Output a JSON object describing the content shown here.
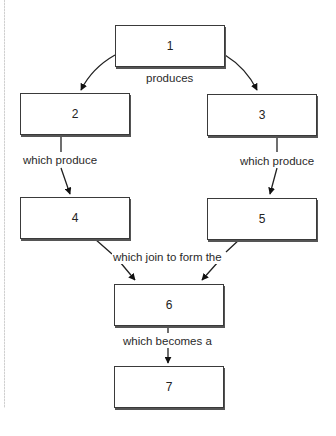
{
  "diagram": {
    "type": "flowchart",
    "nodes": [
      {
        "id": "1",
        "label": "1"
      },
      {
        "id": "2",
        "label": "2"
      },
      {
        "id": "3",
        "label": "3"
      },
      {
        "id": "4",
        "label": "4"
      },
      {
        "id": "5",
        "label": "5"
      },
      {
        "id": "6",
        "label": "6"
      },
      {
        "id": "7",
        "label": "7"
      }
    ],
    "edge_labels": {
      "produces": "produces",
      "left_produce": "which produce",
      "right_produce": "which produce",
      "join": "which join to form the",
      "becomes": "which becomes a"
    },
    "edges": [
      {
        "from": "1",
        "to": "2",
        "label": "produces"
      },
      {
        "from": "1",
        "to": "3",
        "label": "produces"
      },
      {
        "from": "2",
        "to": "4",
        "label": "which produce"
      },
      {
        "from": "3",
        "to": "5",
        "label": "which produce"
      },
      {
        "from": "4",
        "to": "6",
        "label": "which join to form the"
      },
      {
        "from": "5",
        "to": "6",
        "label": "which join to form the"
      },
      {
        "from": "6",
        "to": "7",
        "label": "which becomes a"
      }
    ]
  }
}
